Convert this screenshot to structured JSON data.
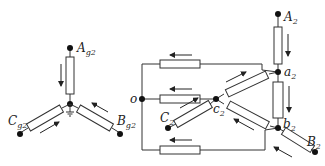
{
  "diagram": {
    "left_star": {
      "nodes": {
        "A": {
          "label": "A",
          "sub": "g2"
        },
        "B": {
          "label": "B",
          "sub": "g2"
        },
        "C": {
          "label": "C",
          "sub": "g2"
        }
      },
      "grounded_center": true
    },
    "right_network": {
      "nodes": {
        "A2": {
          "label": "A",
          "sub": "2"
        },
        "B2": {
          "label": "B",
          "sub": "2"
        },
        "C2": {
          "label": "C",
          "sub": "2"
        },
        "a2": {
          "label": "a",
          "sub": "2"
        },
        "b2": {
          "label": "b",
          "sub": "2"
        },
        "c2": {
          "label": "c",
          "sub": "2"
        },
        "o": {
          "label": "o",
          "sub": ""
        }
      }
    },
    "colors": {
      "line": "#333333",
      "node": "#111111",
      "background": "#ffffff"
    }
  }
}
